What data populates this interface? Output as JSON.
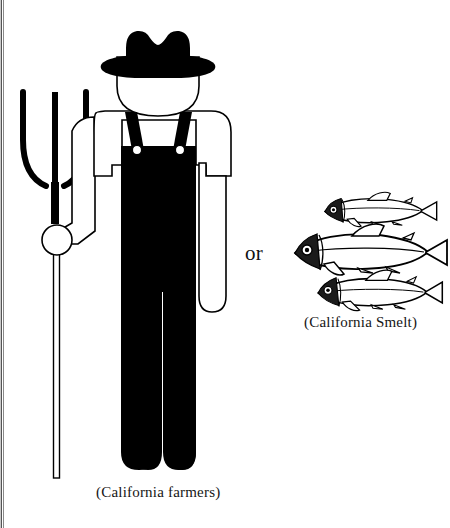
{
  "figure": {
    "type": "line-drawing-comparison",
    "background_color": "#ffffff",
    "ink_color": "#000000",
    "or_label": "or",
    "farmer_caption": "(California farmers)",
    "smelt_caption": "(California Smelt)",
    "left_subject": {
      "name": "california-farmer",
      "description": "Silhouette of a farmer wearing a cowboy hat and black bib overalls, holding a three-tined pitchfork in his right hand",
      "parts": [
        "cowboy-hat",
        "face",
        "shirt",
        "overalls-bib",
        "overalls-straps",
        "overalls-buttons",
        "left-arm",
        "right-arm",
        "legs",
        "pitchfork"
      ]
    },
    "right_subject": {
      "name": "california-smelt",
      "description": "Three outline drawings of smelt fish arranged in a staggered stack",
      "fish_count": 3,
      "fish": [
        {
          "id": "smelt-top",
          "size": "small",
          "x": 318,
          "y": 196,
          "w": 116,
          "h": 30
        },
        {
          "id": "smelt-middle",
          "size": "large",
          "x": 286,
          "y": 231,
          "w": 134,
          "h": 42
        },
        {
          "id": "smelt-bottom",
          "size": "medium",
          "x": 310,
          "y": 275,
          "w": 120,
          "h": 36
        }
      ]
    },
    "scan_artifact": {
      "name": "page-gutter-edge",
      "position": "left",
      "width_px": 4
    }
  }
}
